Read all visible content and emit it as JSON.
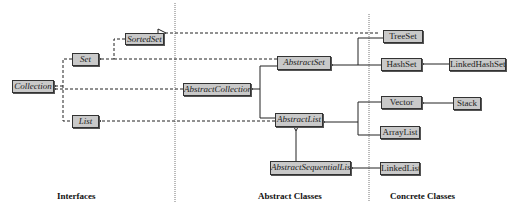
{
  "diagram": {
    "columns": {
      "interfaces": "Interfaces",
      "abstract_classes": "Abstract Classes",
      "concrete_classes": "Concrete Classes"
    },
    "interfaces": {
      "collection": "Collection",
      "set": "Set",
      "sorted_set": "SortedSet",
      "list": "List"
    },
    "abstract_classes": {
      "abstract_collection": "AbstractCollection",
      "abstract_set": "AbstractSet",
      "abstract_list": "AbstractList",
      "abstract_sequential_list": "AbstractSequentialList"
    },
    "concrete_classes": {
      "tree_set": "TreeSet",
      "hash_set": "HashSet",
      "linked_hash_set": "LinkedHashSet",
      "vector": "Vector",
      "stack": "Stack",
      "array_list": "ArrayList",
      "linked_list": "LinkedList"
    },
    "relationships": [
      {
        "from": "Set",
        "to": "Collection",
        "type": "extends-interface"
      },
      {
        "from": "List",
        "to": "Collection",
        "type": "extends-interface"
      },
      {
        "from": "SortedSet",
        "to": "Set",
        "type": "extends-interface"
      },
      {
        "from": "AbstractCollection",
        "to": "Collection",
        "type": "implements"
      },
      {
        "from": "AbstractSet",
        "to": "Set",
        "type": "implements"
      },
      {
        "from": "AbstractList",
        "to": "List",
        "type": "implements"
      },
      {
        "from": "TreeSet",
        "to": "SortedSet",
        "type": "implements"
      },
      {
        "from": "AbstractSet",
        "to": "AbstractCollection",
        "type": "extends"
      },
      {
        "from": "AbstractList",
        "to": "AbstractCollection",
        "type": "extends"
      },
      {
        "from": "AbstractSequentialList",
        "to": "AbstractList",
        "type": "extends"
      },
      {
        "from": "TreeSet",
        "to": "AbstractSet",
        "type": "extends"
      },
      {
        "from": "HashSet",
        "to": "AbstractSet",
        "type": "extends"
      },
      {
        "from": "LinkedHashSet",
        "to": "HashSet",
        "type": "extends"
      },
      {
        "from": "Vector",
        "to": "AbstractList",
        "type": "extends"
      },
      {
        "from": "ArrayList",
        "to": "AbstractList",
        "type": "extends"
      },
      {
        "from": "Stack",
        "to": "Vector",
        "type": "extends"
      },
      {
        "from": "LinkedList",
        "to": "AbstractSequentialList",
        "type": "extends"
      }
    ]
  }
}
